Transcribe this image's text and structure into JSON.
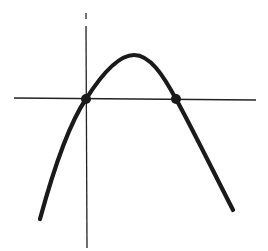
{
  "diagram": {
    "type": "parabola-sketch",
    "colors": {
      "background": "#ffffff",
      "axes": "#222222",
      "curve": "#1a1a1a",
      "points": "#1a1a1a"
    },
    "axes": {
      "x_axis": {
        "x1": 14,
        "y1": 98,
        "x2": 256,
        "y2": 100
      },
      "y_axis_top_tick": {
        "x1": 86,
        "y1": 13,
        "x2": 86,
        "y2": 19
      },
      "y_axis": {
        "x1": 86,
        "y1": 26,
        "x2": 87,
        "y2": 248
      }
    },
    "curve_path": "M 40 219 C 52 175, 68 125, 86 99 C 100 77, 118 55, 134 55 C 150 55, 163 75, 176 99 C 192 128, 215 175, 233 210",
    "roots": [
      {
        "label": "root-left",
        "cx": 86,
        "cy": 99,
        "r": 5
      },
      {
        "label": "root-right",
        "cx": 176,
        "cy": 99,
        "r": 5
      }
    ]
  }
}
